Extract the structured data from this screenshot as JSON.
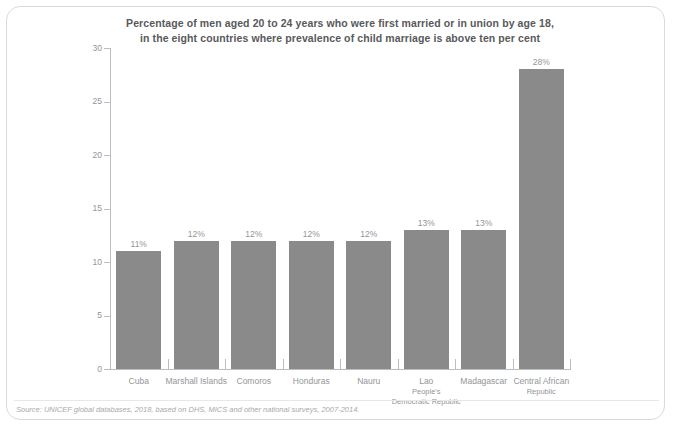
{
  "chart_data": {
    "type": "bar",
    "title": "Percentage of men aged 20 to 24 years who were first married or in union by age 18, in the eight countries where prevalence of child marriage is above ten per cent",
    "title_lines": [
      "Percentage of men aged 20 to 24 years who were first married or in union by age 18,",
      "in the eight countries where prevalence of child marriage is above ten per cent"
    ],
    "categories": [
      "Cuba",
      "Marshall Islands",
      "Comoros",
      "Honduras",
      "Nauru",
      "Lao People's Democratic Republic",
      "Madagascar",
      "Central African Republic"
    ],
    "category_label_lines": [
      [
        "Cuba"
      ],
      [
        "Marshall Islands"
      ],
      [
        "Comoros"
      ],
      [
        "Honduras"
      ],
      [
        "Nauru"
      ],
      [
        "Lao",
        "People's",
        "Democratic Republic"
      ],
      [
        "Madagascar"
      ],
      [
        "Central African",
        "Republic"
      ]
    ],
    "values": [
      11,
      12,
      12,
      12,
      12,
      13,
      13,
      28
    ],
    "data_labels": [
      "11%",
      "12%",
      "12%",
      "12%",
      "12%",
      "13%",
      "13%",
      "28%"
    ],
    "xlabel": "",
    "ylabel": "",
    "ylim": [
      0,
      30
    ],
    "y_ticks": [
      0,
      5,
      10,
      15,
      20,
      25,
      30
    ],
    "y_tick_labels": [
      "0",
      "5",
      "10",
      "15",
      "20",
      "25",
      "30"
    ],
    "grid": false,
    "legend": false,
    "bar_color": "#8a8a8a",
    "axis_color": "#bcbec0",
    "label_color": "#939598",
    "title_color": "#58595b"
  },
  "footer": {
    "source": "Source: UNICEF global databases, 2018, based on DHS, MICS and other national surveys, 2007-2014."
  }
}
